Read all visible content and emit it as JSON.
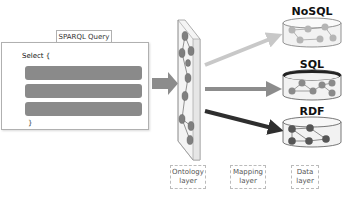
{
  "query_panel": {
    "title": "SPARQL Query",
    "select_keyword": "Select {",
    "close_brace": "}",
    "placeholder_bars": 3
  },
  "ontology": {
    "node_count": 9
  },
  "databases": [
    {
      "label": "NoSQL",
      "arrow_color": "#c8c8c8",
      "fill": "#d9d9d9",
      "node_color": "#b5b5b5"
    },
    {
      "label": "SQL",
      "arrow_color": "#8c8c8c",
      "fill": "#e2e2e2",
      "node_color": "#8a8a8a"
    },
    {
      "label": "RDF",
      "arrow_color": "#2e2e2e",
      "fill": "#dcdcdc",
      "node_color": "#555555"
    }
  ],
  "layer_labels": {
    "ontology": "Ontology layer",
    "mapping": "Mapping layer",
    "data": "Data layer"
  },
  "colors": {
    "main_arrow": "#8c8c8c",
    "bar": "#8a8a8a",
    "ontology_node": "#7f7f7f"
  }
}
